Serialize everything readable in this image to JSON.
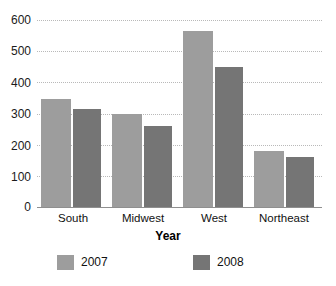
{
  "chart_data": {
    "type": "bar",
    "title": "",
    "xlabel": "Year",
    "ylabel": "",
    "categories": [
      "South",
      "Midwest",
      "West",
      "Northeast"
    ],
    "series": [
      {
        "name": "2007",
        "color": "#9d9d9d",
        "values": [
          345,
          300,
          565,
          180
        ]
      },
      {
        "name": "2008",
        "color": "#757575",
        "values": [
          315,
          260,
          450,
          160
        ]
      }
    ],
    "ylim": [
      0,
      600
    ],
    "yticks": [
      0,
      100,
      200,
      300,
      400,
      500,
      600
    ],
    "ytick_labels": [
      "0",
      "100",
      "200",
      "300",
      "400",
      "500",
      "600"
    ],
    "grid": "horizontal-dotted",
    "legend_position": "bottom",
    "legend_entries": [
      "2007",
      "2008"
    ]
  }
}
